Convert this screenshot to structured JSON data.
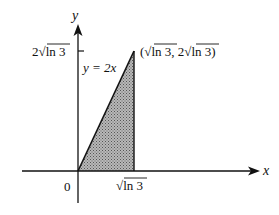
{
  "diagram": {
    "axes": {
      "x_label": "x",
      "y_label": "y",
      "origin_label": "0"
    },
    "ticks": {
      "x_tick_label": "√ln 3",
      "y_tick_label": "2√ln 3"
    },
    "line": {
      "equation_label": "y = 2x"
    },
    "point": {
      "label": "(√ln 3, 2√ln 3)"
    },
    "region": {
      "description": "shaded triangle bounded by y = 2x, x = √ln 3, and the x-axis",
      "fill": "#9a9a9a"
    },
    "colors": {
      "ink": "#111111",
      "background": "#ffffff"
    }
  }
}
